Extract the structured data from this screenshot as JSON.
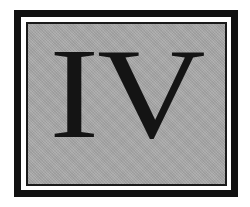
{
  "badge": {
    "numeral": "IV",
    "colors": {
      "frame": "#111111",
      "gap": "#ffffff",
      "fill": "#a9a9a9",
      "text": "#141414"
    }
  }
}
